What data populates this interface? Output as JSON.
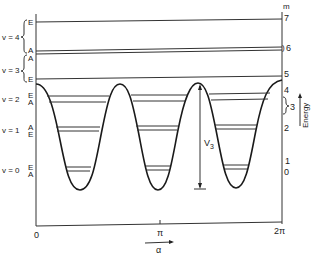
{
  "diagram": {
    "type": "torsional potential energy level diagram",
    "x_axis": {
      "label": "α",
      "ticks": [
        "0",
        "π",
        "2π"
      ]
    },
    "right_axis": {
      "header": "m",
      "labels": [
        "7",
        "6",
        "5",
        "4",
        "3",
        "2",
        "1",
        "0"
      ],
      "title": "Energy"
    },
    "barrier_label": "V3",
    "barrier_label_main": "V",
    "barrier_label_sub": "3",
    "levels": [
      {
        "v": "v = 4",
        "upper": "E",
        "lower": "A"
      },
      {
        "v": "v = 3",
        "upper": "A",
        "lower": "E"
      },
      {
        "v": "v = 2",
        "upper": "E",
        "lower": "A"
      },
      {
        "v": "v = 1",
        "upper": "A",
        "lower": "E"
      },
      {
        "v": "v = 0",
        "upper": "E",
        "lower": "A"
      }
    ]
  }
}
